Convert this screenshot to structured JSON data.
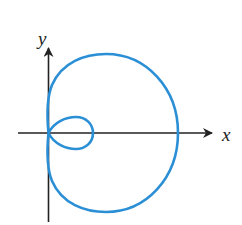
{
  "diagram": {
    "type": "polar-curve-limacon",
    "x_axis_label": "x",
    "y_axis_label": "y",
    "curve_color": "#2b8fd6",
    "axis_color": "#222222"
  }
}
